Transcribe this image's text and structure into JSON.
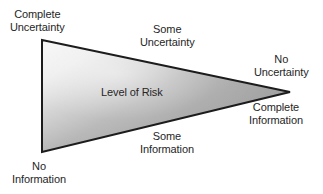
{
  "figure": {
    "name": "level-of-risk-wedge-diagram",
    "background_color": "#ffffff",
    "outline_color": "#1c1c1c",
    "text_color": "#262626",
    "gradient": {
      "light_color": "#f2f2f2",
      "mid_color": "#a8a8a8",
      "dark_color": "#9a9a9a"
    },
    "geometry": {
      "top_left": [
        42,
        40
      ],
      "bottom_left": [
        42,
        152
      ],
      "apex_right": [
        290,
        92
      ]
    }
  },
  "labels": {
    "complete_uncertainty": {
      "line1": "Complete",
      "line2": "Uncertainty"
    },
    "some_uncertainty": {
      "line1": "Some",
      "line2": "Uncertainty"
    },
    "no_uncertainty": {
      "line1": "No",
      "line2": "Uncertainty"
    },
    "level_of_risk": {
      "line1": "Level of Risk"
    },
    "complete_information": {
      "line1": "Complete",
      "line2": "Information"
    },
    "some_information": {
      "line1": "Some",
      "line2": "Information"
    },
    "no_information": {
      "line1": "No",
      "line2": "Information"
    }
  }
}
